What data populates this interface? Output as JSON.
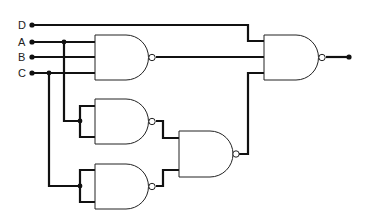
{
  "diagram": {
    "type": "logic-circuit",
    "inputs": [
      {
        "label": "D",
        "y": 25
      },
      {
        "label": "A",
        "y": 42
      },
      {
        "label": "B",
        "y": 57
      },
      {
        "label": "C",
        "y": 73
      }
    ],
    "gates": [
      {
        "id": "nand1",
        "type": "NAND",
        "inputs": [
          "A",
          "B",
          "C"
        ]
      },
      {
        "id": "nand2",
        "type": "NAND",
        "inputs": [
          "A",
          "A"
        ]
      },
      {
        "id": "nand3",
        "type": "NAND",
        "inputs": [
          "C",
          "C"
        ]
      },
      {
        "id": "nand5",
        "type": "NAND",
        "inputs": [
          "nand2",
          "nand3"
        ]
      },
      {
        "id": "nand4",
        "type": "NAND",
        "inputs": [
          "D",
          "nand1",
          "nand5"
        ]
      }
    ],
    "output": {
      "from": "nand4"
    }
  }
}
